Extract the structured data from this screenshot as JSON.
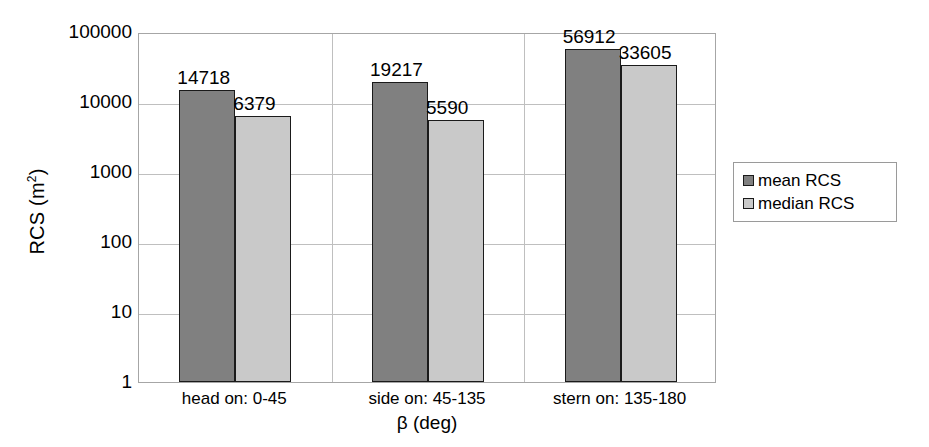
{
  "chart_data": {
    "type": "bar",
    "title": "",
    "xlabel": "β (deg)",
    "ylabel": "RCS (m²)",
    "ylabel_base": "RCS (m",
    "ylabel_sup": "2",
    "ylabel_tail": ")",
    "yscale": "log",
    "ylim": [
      1,
      100000
    ],
    "ytick_labels": [
      "100000",
      "10000",
      "1000",
      "100",
      "10",
      "1"
    ],
    "ytick_values": [
      100000,
      10000,
      1000,
      100,
      10,
      1
    ],
    "grid": "both",
    "legend_position": "right",
    "categories": [
      "head on:  0-45",
      "side on: 45-135",
      "stern on: 135-180"
    ],
    "series": [
      {
        "name": "mean RCS",
        "color": "#808080",
        "values": [
          14718,
          19217,
          56912
        ],
        "labels": [
          "14718",
          "19217",
          "56912"
        ]
      },
      {
        "name": "median RCS",
        "color": "#c9c9c9",
        "values": [
          6379,
          5590,
          33605
        ],
        "labels": [
          "6379",
          "5590",
          "33605"
        ]
      }
    ]
  },
  "legend": {
    "items": [
      {
        "label": "mean RCS",
        "swatch": "mean"
      },
      {
        "label": "median RCS",
        "swatch": "median"
      }
    ]
  }
}
